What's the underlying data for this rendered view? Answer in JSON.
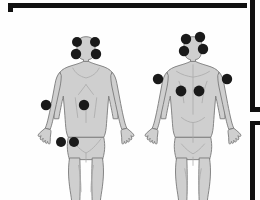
{
  "diagram": {
    "title": "Fibromyalgia Tender Point Locations",
    "type": "anatomical-body-map",
    "view_count": 2,
    "total_tender_points": 18,
    "background_color": "#fefefe",
    "body_fill_color": "#cfcfcf",
    "body_shade_color": "#bcbcbc",
    "body_outline_color": "#7a7a7a",
    "tender_point_color": "#1a1a1a",
    "frame_color": "#111111",
    "views": [
      {
        "id": "anterior",
        "label": "Anterior view",
        "center_x": 86,
        "point_count": 8,
        "points": [
          {
            "name": "low-cervical-left",
            "label": "Low cervical (left)",
            "x": 77,
            "y": 42,
            "r": 5.0
          },
          {
            "name": "low-cervical-right",
            "label": "Low cervical (right)",
            "x": 95,
            "y": 42,
            "r": 5.0
          },
          {
            "name": "second-rib-left",
            "label": "Second rib (left)",
            "x": 76,
            "y": 54,
            "r": 5.2
          },
          {
            "name": "second-rib-right",
            "label": "Second rib (right)",
            "x": 96,
            "y": 54,
            "r": 5.2
          },
          {
            "name": "trochanter-left",
            "label": "Greater trochanter (left)",
            "x": 46,
            "y": 105,
            "r": 5.2
          },
          {
            "name": "trochanter-right",
            "label": "Greater trochanter (right)",
            "x": 84,
            "y": 105,
            "r": 5.2
          },
          {
            "name": "knee-left",
            "label": "Medial knee (left)",
            "x": 61,
            "y": 142,
            "r": 5.0
          },
          {
            "name": "knee-right",
            "label": "Medial knee (right)",
            "x": 74,
            "y": 142,
            "r": 5.0
          }
        ]
      },
      {
        "id": "posterior",
        "label": "Posterior view",
        "center_x": 193,
        "point_count": 8,
        "points": [
          {
            "name": "occiput-left",
            "label": "Occiput (left)",
            "x": 186,
            "y": 39,
            "r": 5.2
          },
          {
            "name": "occiput-right",
            "label": "Occiput (right)",
            "x": 200,
            "y": 37,
            "r": 5.2
          },
          {
            "name": "trapezius-left",
            "label": "Trapezius (left)",
            "x": 184,
            "y": 51,
            "r": 5.2
          },
          {
            "name": "trapezius-right",
            "label": "Trapezius (right)",
            "x": 203,
            "y": 49,
            "r": 5.2
          },
          {
            "name": "lateral-epicondyle-left",
            "label": "Lateral epicondyle (left)",
            "x": 158,
            "y": 79,
            "r": 5.2
          },
          {
            "name": "lateral-epicondyle-right",
            "label": "Lateral epicondyle (right)",
            "x": 227,
            "y": 79,
            "r": 5.2
          },
          {
            "name": "gluteal-left",
            "label": "Gluteal (left)",
            "x": 181,
            "y": 91,
            "r": 5.4
          },
          {
            "name": "gluteal-right",
            "label": "Gluteal (right)",
            "x": 199,
            "y": 91,
            "r": 5.4
          }
        ]
      }
    ],
    "frame_segments": [
      {
        "name": "frame-top-bar",
        "x": 8,
        "y": 3,
        "w": 239,
        "h": 5
      },
      {
        "name": "frame-top-left-tick",
        "x": 8,
        "y": 3,
        "w": 5,
        "h": 9
      },
      {
        "name": "frame-right-upper-bar",
        "x": 250,
        "y": 0,
        "w": 5,
        "h": 112
      },
      {
        "name": "frame-right-lower-bar",
        "x": 250,
        "y": 121,
        "w": 5,
        "h": 79
      },
      {
        "name": "frame-right-lower-tick",
        "x": 250,
        "y": 121,
        "w": 10,
        "h": 4
      },
      {
        "name": "frame-right-mid-tick",
        "x": 250,
        "y": 107,
        "w": 10,
        "h": 5
      }
    ]
  }
}
